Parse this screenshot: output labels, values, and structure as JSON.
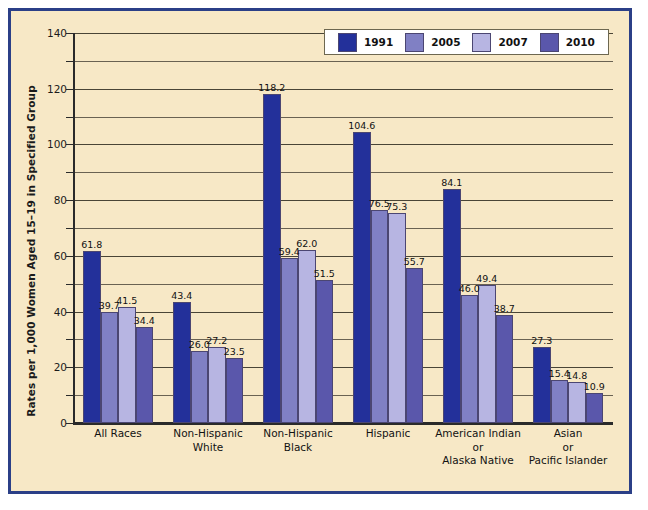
{
  "chart_data": {
    "type": "bar",
    "title": "",
    "xlabel": "",
    "ylabel": "Rates per 1,000 Women Aged 15–19 in Specified Group",
    "ylim": [
      0,
      140
    ],
    "ytick_labels": [
      "0",
      "20",
      "40",
      "60",
      "80",
      "100",
      "120",
      "140"
    ],
    "ytick_values": [
      0,
      20,
      40,
      60,
      80,
      100,
      120,
      140
    ],
    "minor_tick_step": 10,
    "grid": true,
    "legend_position": "top-center",
    "categories": [
      "All Races",
      "Non-Hispanic\nWhite",
      "Non-Hispanic\nBlack",
      "Hispanic",
      "American Indian\nor\nAlaska Native",
      "Asian\nor\nPacific Islander"
    ],
    "category_lines": [
      [
        "All Races"
      ],
      [
        "Non-Hispanic",
        "White"
      ],
      [
        "Non-Hispanic",
        "Black"
      ],
      [
        "Hispanic"
      ],
      [
        "American Indian",
        "or",
        "Alaska Native"
      ],
      [
        "Asian",
        "or",
        "Pacific Islander"
      ]
    ],
    "series": [
      {
        "name": "1991",
        "color": "#23309a",
        "values": [
          61.8,
          43.4,
          118.2,
          104.6,
          84.1,
          27.3
        ]
      },
      {
        "name": "2005",
        "color": "#8080c4",
        "values": [
          39.7,
          26.0,
          59.4,
          76.5,
          46.0,
          15.4
        ]
      },
      {
        "name": "2007",
        "color": "#b7b5e2",
        "values": [
          41.5,
          27.2,
          62.0,
          75.3,
          49.4,
          14.8
        ]
      },
      {
        "name": "2010",
        "color": "#5a57ab",
        "values": [
          34.4,
          23.5,
          51.5,
          55.7,
          38.7,
          10.9
        ]
      }
    ],
    "value_labels": [
      [
        "61.8",
        "39.7",
        "41.5",
        "34.4"
      ],
      [
        "43.4",
        "26.0",
        "27.2",
        "23.5"
      ],
      [
        "118.2",
        "59.4",
        "62.0",
        "51.5"
      ],
      [
        "104.6",
        "76.5",
        "75.3",
        "55.7"
      ],
      [
        "84.1",
        "46.0",
        "49.4",
        "38.7"
      ],
      [
        "27.3",
        "15.4",
        "14.8",
        "10.9"
      ]
    ]
  },
  "colors": {
    "frame_border": "#2b3f87",
    "plot_background": "#f7e8c6",
    "axis": "#2a2a2a",
    "gridline": "#6a6252",
    "legend_background": "#ffffff",
    "text": "#111111"
  }
}
